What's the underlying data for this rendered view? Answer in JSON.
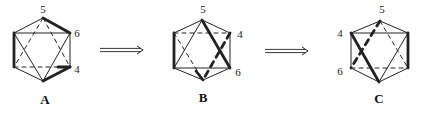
{
  "diagram": {
    "colors": {
      "line": "#222222",
      "background": "#ffffff"
    },
    "stroke": {
      "thin": 1,
      "thick": 2.8
    },
    "arrows": [
      {
        "id": "arrow-a-to-b",
        "from": [
          100,
          50
        ],
        "to": [
          143,
          50
        ],
        "style": "double"
      },
      {
        "id": "arrow-b-to-c",
        "from": [
          265,
          51
        ],
        "to": [
          308,
          51
        ],
        "style": "double"
      }
    ],
    "figures": [
      {
        "id": "A",
        "label": "A",
        "label_pos": [
          45,
          104
        ],
        "vertices": {
          "T": [
            43,
            18
          ],
          "UL": [
            14,
            33
          ],
          "UR": [
            70,
            33
          ],
          "LR": [
            70,
            67
          ],
          "B": [
            43,
            81
          ],
          "LL": [
            14,
            67
          ]
        },
        "vertex_labels": [
          {
            "text": "5",
            "pos": [
              43,
              13
            ]
          },
          {
            "text": "6",
            "pos": [
              77,
              37
            ]
          },
          {
            "text": "4",
            "pos": [
              77,
              73
            ]
          }
        ],
        "edges": [
          {
            "a": "T",
            "b": "UL",
            "w": "thin"
          },
          {
            "a": "T",
            "b": "UR",
            "w": "thick"
          },
          {
            "a": "UR",
            "b": "LR",
            "w": "thin"
          },
          {
            "a": "LR",
            "b": "B",
            "w": "thick"
          },
          {
            "a": "B",
            "b": "LL",
            "w": "thin"
          },
          {
            "a": "LL",
            "b": "UL",
            "w": "thick"
          },
          {
            "a": "UL",
            "b": "UR",
            "w": "thin"
          },
          {
            "a": "LL",
            "b": "LR",
            "w": "thin",
            "dash": true
          },
          {
            "p1": [
              58,
              67
            ],
            "p2": [
              70,
              67
            ],
            "w": "thick"
          },
          {
            "a": "UL",
            "b": "B",
            "w": "thin"
          },
          {
            "a": "UR",
            "b": "B",
            "w": "thin"
          },
          {
            "a": "T",
            "b": "LL",
            "w": "thin",
            "dash": true
          },
          {
            "a": "T",
            "b": "LR",
            "w": "thin",
            "dash": true
          }
        ]
      },
      {
        "id": "B",
        "label": "B",
        "label_pos": [
          203,
          102
        ],
        "vertices": {
          "T": [
            202,
            20
          ],
          "UL": [
            174,
            33
          ],
          "UR": [
            230,
            33
          ],
          "LR": [
            230,
            68
          ],
          "B": [
            203,
            80
          ],
          "LL": [
            174,
            68
          ]
        },
        "vertex_labels": [
          {
            "text": "5",
            "pos": [
              203,
              13
            ]
          },
          {
            "text": "4",
            "pos": [
              240,
              38
            ]
          },
          {
            "text": "6",
            "pos": [
              238,
              76
            ]
          }
        ],
        "edges": [
          {
            "a": "T",
            "b": "UL",
            "w": "thin"
          },
          {
            "a": "T",
            "b": "UR",
            "w": "thin"
          },
          {
            "a": "UL",
            "b": "UR",
            "w": "thin",
            "dash": true
          },
          {
            "a": "UL",
            "b": "LL",
            "w": "thick"
          },
          {
            "a": "UR",
            "b": "LR",
            "w": "thin"
          },
          {
            "a": "LL",
            "b": "B",
            "w": "thin"
          },
          {
            "a": "LR",
            "b": "B",
            "w": "thin"
          },
          {
            "a": "LL",
            "b": "LR",
            "w": "thin"
          },
          {
            "a": "T",
            "b": "LL",
            "w": "thin"
          },
          {
            "a": "T",
            "b": "LR",
            "w": "thick"
          },
          {
            "a": "UL",
            "b": "B",
            "w": "thin",
            "dash": true
          },
          {
            "p1": [
              196,
              71
            ],
            "p2": [
              203,
              80
            ],
            "w": "thick"
          },
          {
            "a": "UR",
            "b": "B",
            "w": "thick",
            "dash": true
          }
        ]
      },
      {
        "id": "C",
        "label": "C",
        "label_pos": [
          379,
          103
        ],
        "vertices": {
          "T": [
            380,
            21
          ],
          "UL": [
            351,
            33
          ],
          "UR": [
            408,
            33
          ],
          "LR": [
            408,
            68
          ],
          "B": [
            379,
            82
          ],
          "LL": [
            351,
            68
          ]
        },
        "vertex_labels": [
          {
            "text": "5",
            "pos": [
              382,
              13
            ]
          },
          {
            "text": "4",
            "pos": [
              340,
              37
            ]
          },
          {
            "text": "6",
            "pos": [
              340,
              75
            ]
          }
        ],
        "edges": [
          {
            "a": "T",
            "b": "UL",
            "w": "thin"
          },
          {
            "a": "T",
            "b": "UR",
            "w": "thin"
          },
          {
            "a": "UL",
            "b": "UR",
            "w": "thin"
          },
          {
            "a": "LL",
            "b": "LR",
            "w": "thin",
            "dash": true
          },
          {
            "a": "UL",
            "b": "LL",
            "w": "thin"
          },
          {
            "a": "UR",
            "b": "LR",
            "w": "thick"
          },
          {
            "a": "LL",
            "b": "B",
            "w": "thin"
          },
          {
            "a": "LR",
            "b": "B",
            "w": "thin"
          },
          {
            "a": "UL",
            "b": "B",
            "w": "thick"
          },
          {
            "a": "UR",
            "b": "B",
            "w": "thin"
          },
          {
            "a": "T",
            "b": "LL",
            "w": "thick",
            "dash": true
          },
          {
            "a": "T",
            "b": "LR",
            "w": "thin",
            "dash": true
          }
        ]
      }
    ]
  }
}
